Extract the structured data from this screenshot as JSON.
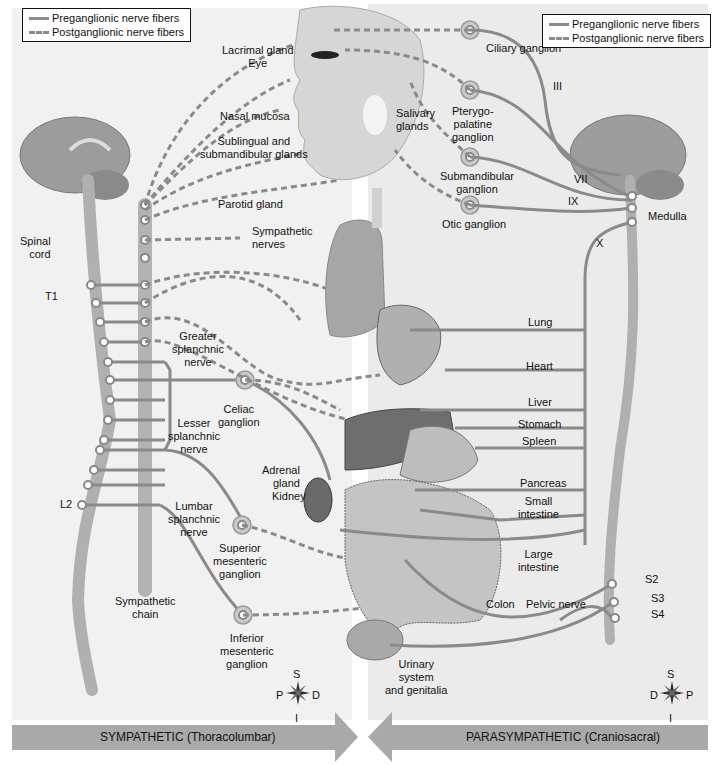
{
  "legend_left": {
    "preganglionic": "Preganglionic nerve fibers",
    "postganglionic": "Postganglionic nerve fibers"
  },
  "legend_right": {
    "preganglionic": "Preganglionic nerve fibers",
    "postganglionic": "Postganglionic nerve fibers"
  },
  "sympathetic": {
    "banner": "SYMPATHETIC (Thoracolumbar)",
    "labels": {
      "spinal_cord_1": "Spinal",
      "spinal_cord_2": "cord",
      "t1": "T1",
      "l2": "L2",
      "greater_1": "Greater",
      "greater_2": "splanchnic",
      "greater_3": "nerve",
      "lesser_1": "Lesser",
      "lesser_2": "splanchnic",
      "lesser_3": "nerve",
      "lumbar_1": "Lumbar",
      "lumbar_2": "splanchnic",
      "lumbar_3": "nerve",
      "celiac_1": "Celiac",
      "celiac_2": "ganglion",
      "sup_mes_1": "Superior",
      "sup_mes_2": "mesenteric",
      "sup_mes_3": "ganglion",
      "inf_mes_1": "Inferior",
      "inf_mes_2": "mesenteric",
      "inf_mes_3": "ganglion",
      "chain_1": "Sympathetic",
      "chain_2": "chain",
      "symp_nerves_1": "Sympathetic",
      "symp_nerves_2": "nerves",
      "parotid": "Parotid gland"
    },
    "compass": {
      "top": "S",
      "bottom": "I",
      "left": "P",
      "right": "D"
    }
  },
  "organs": {
    "lacrimal": "Lacrimal gland",
    "eye": "Eye",
    "nasal": "Nasal mucosa",
    "sublingual_1": "Sublingual and",
    "sublingual_2": "submandibular glands",
    "salivary_1": "Salivary",
    "salivary_2": "glands",
    "adrenal_1": "Adrenal",
    "adrenal_2": "gland",
    "kidney": "Kidney",
    "urinary_1": "Urinary",
    "urinary_2": "system",
    "urinary_3": "and genitalia",
    "colon": "Colon"
  },
  "parasympathetic": {
    "banner": "PARASYMPATHETIC (Craniosacral)",
    "labels": {
      "ciliary": "Ciliary ganglion",
      "ptery_1": "Pterygo-",
      "ptery_2": "palatine",
      "ptery_3": "ganglion",
      "submand_1": "Submandibular",
      "submand_2": "ganglion",
      "otic": "Otic ganglion",
      "iii": "III",
      "vii": "VII",
      "ix": "IX",
      "x": "X",
      "medulla": "Medulla",
      "lung": "Lung",
      "heart": "Heart",
      "liver": "Liver",
      "stomach": "Stomach",
      "spleen": "Spleen",
      "pancreas": "Pancreas",
      "small_1": "Small",
      "small_2": "intestine",
      "large_1": "Large",
      "large_2": "intestine",
      "pelvic": "Pelvic nerve",
      "s2": "S2",
      "s3": "S3",
      "s4": "S4"
    },
    "compass": {
      "top": "S",
      "bottom": "I",
      "left": "D",
      "right": "P"
    }
  },
  "colors": {
    "nerve": "#8a8a8a",
    "banner": "#a9a9a9",
    "organ": "#b8b8b8",
    "panel_left": "#f1f1f1",
    "panel_right": "#ebebeb"
  }
}
